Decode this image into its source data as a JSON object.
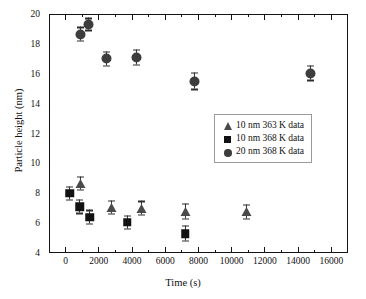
{
  "chart_data": {
    "type": "scatter",
    "title": "",
    "xlabel": "Time (s)",
    "ylabel": "Particle height (nm)",
    "xlim": [
      -1000,
      17000
    ],
    "ylim": [
      4,
      20
    ],
    "xticks": [
      0,
      2000,
      4000,
      6000,
      8000,
      10000,
      12000,
      14000,
      16000
    ],
    "xticklabels": [
      "0",
      "2000",
      "4000",
      "6000",
      "8000",
      "10000",
      "12000",
      "14000",
      "16000"
    ],
    "yticks": [
      4,
      6,
      8,
      10,
      12,
      14,
      16,
      18,
      20
    ],
    "yticklabels": [
      "4",
      "6",
      "8",
      "10",
      "12",
      "14",
      "16",
      "18",
      "20"
    ],
    "x_minor_interval": 1000,
    "y_minor_interval": 1,
    "grid": false,
    "legend_position": "center right",
    "series": [
      {
        "name": "10 nm 363 K data",
        "marker": "triangle",
        "color": "#4a4a4a",
        "points": [
          {
            "x": 900,
            "y": 8.65,
            "yerr": 0.45
          },
          {
            "x": 2750,
            "y": 7.05,
            "yerr": 0.45
          },
          {
            "x": 4550,
            "y": 7.0,
            "yerr": 0.45
          },
          {
            "x": 7200,
            "y": 6.8,
            "yerr": 0.5
          },
          {
            "x": 10900,
            "y": 6.75,
            "yerr": 0.45
          }
        ]
      },
      {
        "name": "10 nm 368 K data",
        "marker": "square",
        "color": "#121212",
        "points": [
          {
            "x": 250,
            "y": 8.0,
            "yerr": 0.45
          },
          {
            "x": 850,
            "y": 7.1,
            "yerr": 0.45
          },
          {
            "x": 1450,
            "y": 6.4,
            "yerr": 0.45
          },
          {
            "x": 3700,
            "y": 6.05,
            "yerr": 0.45
          },
          {
            "x": 7200,
            "y": 5.3,
            "yerr": 0.5
          }
        ]
      },
      {
        "name": "20 nm 368 K data",
        "marker": "circle",
        "color": "#3d3d3d",
        "points": [
          {
            "x": 900,
            "y": 18.65,
            "yerr": 0.45
          },
          {
            "x": 1400,
            "y": 19.3,
            "yerr": 0.4
          },
          {
            "x": 2450,
            "y": 17.0,
            "yerr": 0.45
          },
          {
            "x": 4250,
            "y": 17.1,
            "yerr": 0.5
          },
          {
            "x": 7750,
            "y": 15.5,
            "yerr": 0.55
          },
          {
            "x": 14750,
            "y": 16.05,
            "yerr": 0.5
          }
        ]
      }
    ]
  }
}
